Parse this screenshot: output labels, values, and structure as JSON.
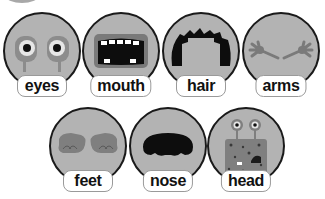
{
  "colors": {
    "circle_fill": "#b3b3b3",
    "circle_outline": "#1a1a1a",
    "label_bg": "#ffffff",
    "label_border": "#9a9a9a",
    "text": "#111111"
  },
  "cards": [
    {
      "label": "eyes",
      "icon": "eyes-icon"
    },
    {
      "label": "mouth",
      "icon": "mouth-icon"
    },
    {
      "label": "hair",
      "icon": "hair-icon"
    },
    {
      "label": "arms",
      "icon": "arms-icon"
    },
    {
      "label": "feet",
      "icon": "feet-icon"
    },
    {
      "label": "nose",
      "icon": "nose-icon"
    },
    {
      "label": "head",
      "icon": "head-icon"
    }
  ]
}
